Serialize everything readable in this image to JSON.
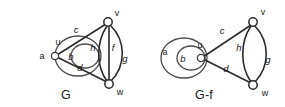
{
  "figure": {
    "background_color": "#ffffff",
    "stroke_color": "#2b2b2b",
    "caption_left": "G",
    "caption_right": "G-f",
    "graphs": [
      {
        "id": "graph-g",
        "caption": "G",
        "vertices": [
          {
            "id": "u",
            "label": "u"
          },
          {
            "id": "v",
            "label": "v"
          },
          {
            "id": "w",
            "label": "w"
          }
        ],
        "edges": [
          {
            "id": "a",
            "label": "a",
            "type": "loop",
            "from": "u",
            "to": "u"
          },
          {
            "id": "b",
            "label": "b",
            "type": "loop",
            "from": "u",
            "to": "u"
          },
          {
            "id": "c",
            "label": "c",
            "type": "straight",
            "from": "u",
            "to": "v"
          },
          {
            "id": "d",
            "label": "d",
            "type": "straight",
            "from": "u",
            "to": "w"
          },
          {
            "id": "h",
            "label": "h",
            "type": "curve-left",
            "from": "v",
            "to": "w"
          },
          {
            "id": "f",
            "label": "f",
            "type": "straight",
            "from": "v",
            "to": "w"
          },
          {
            "id": "g",
            "label": "g",
            "type": "curve-right",
            "from": "v",
            "to": "w"
          }
        ]
      },
      {
        "id": "graph-g-minus-f",
        "caption": "G-f",
        "vertices": [
          {
            "id": "u",
            "label": "u"
          },
          {
            "id": "v",
            "label": "v"
          },
          {
            "id": "w",
            "label": "w"
          }
        ],
        "edges": [
          {
            "id": "a",
            "label": "a",
            "type": "loop",
            "from": "u",
            "to": "u"
          },
          {
            "id": "b",
            "label": "b",
            "type": "loop",
            "from": "u",
            "to": "u"
          },
          {
            "id": "c",
            "label": "c",
            "type": "straight",
            "from": "u",
            "to": "v"
          },
          {
            "id": "d",
            "label": "d",
            "type": "straight",
            "from": "u",
            "to": "w"
          },
          {
            "id": "h",
            "label": "h",
            "type": "curve-left",
            "from": "v",
            "to": "w"
          },
          {
            "id": "g",
            "label": "g",
            "type": "curve-right",
            "from": "v",
            "to": "w"
          }
        ]
      }
    ],
    "labels": {
      "left": {
        "a": "a",
        "b": "b",
        "c": "c",
        "d": "d",
        "h": "h",
        "f": "f",
        "g": "g",
        "u": "u",
        "v": "v",
        "w": "w",
        "caption": "G"
      },
      "right": {
        "a": "a",
        "b": "b",
        "c": "c",
        "d": "d",
        "h": "h",
        "g": "g",
        "u": "u",
        "v": "v",
        "w": "w",
        "caption": "G-f"
      }
    }
  }
}
